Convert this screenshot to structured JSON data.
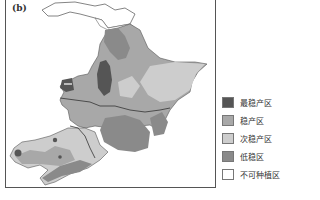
{
  "figure": {
    "panel_label": "(b)"
  },
  "legend": {
    "items": [
      {
        "label": "最稳产区",
        "color": "#555555"
      },
      {
        "label": "稳产区",
        "color": "#a8a8a8"
      },
      {
        "label": "次稳产区",
        "color": "#cdcdcd"
      },
      {
        "label": "低稳区",
        "color": "#8a8a8a"
      },
      {
        "label": "不可种植区",
        "color": "#ffffff"
      }
    ]
  },
  "colors": {
    "most_stable": "#555555",
    "stable": "#a8a8a8",
    "sub_stable": "#cdcdcd",
    "low_stable": "#8a8a8a",
    "not_plantable": "#ffffff",
    "border": "#444444"
  }
}
